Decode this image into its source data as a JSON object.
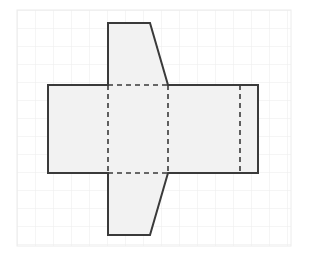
{
  "figure": {
    "canvas": {
      "width": 309,
      "height": 264,
      "background": "#ffffff"
    },
    "grid": {
      "name": "graph-paper-grid",
      "x": 17,
      "y": 10,
      "width": 274,
      "height": 236,
      "cell_size": 18,
      "line_color": "#ececec",
      "line_width": 1,
      "visible": true
    },
    "shape": {
      "name": "arrow-net-polygon",
      "fill_color": "#f2f2f2",
      "stroke_color": "#3a3a3a",
      "stroke_width": 2,
      "outline_points": [
        [
          108,
          23
        ],
        [
          150,
          23
        ],
        [
          168,
          85
        ],
        [
          258,
          85
        ],
        [
          258,
          173
        ],
        [
          168,
          173
        ],
        [
          150,
          235
        ],
        [
          108,
          235
        ],
        [
          108,
          173
        ],
        [
          48,
          173
        ],
        [
          48,
          85
        ],
        [
          108,
          85
        ]
      ],
      "fold_lines": {
        "name": "dashed-fold-lines",
        "stroke_color": "#3a3a3a",
        "stroke_width": 1.6,
        "dash_pattern": "5,4",
        "segments": [
          {
            "label": "left-vertical-fold",
            "x1": 108,
            "y1": 85,
            "x2": 108,
            "y2": 173
          },
          {
            "label": "middle-vertical-fold",
            "x1": 168,
            "y1": 85,
            "x2": 168,
            "y2": 173
          },
          {
            "label": "right-vertical-fold",
            "x1": 240,
            "y1": 85,
            "x2": 240,
            "y2": 173
          },
          {
            "label": "top-horizontal-fold",
            "x1": 108,
            "y1": 85,
            "x2": 168,
            "y2": 85
          },
          {
            "label": "bottom-horizontal-fold",
            "x1": 108,
            "y1": 173,
            "x2": 168,
            "y2": 173
          }
        ]
      }
    }
  }
}
